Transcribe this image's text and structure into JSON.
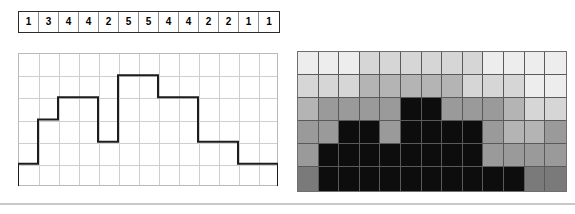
{
  "figure": {
    "panels": {
      "value_strip_name": "Value row",
      "step_chart_name": "Step chart",
      "heatmap_name": "Heatmap"
    }
  },
  "chart_data": [
    {
      "type": "table",
      "title": "",
      "categories": [
        "1",
        "2",
        "3",
        "4",
        "5",
        "6",
        "7",
        "8",
        "9",
        "10",
        "11",
        "12",
        "13"
      ],
      "values": [
        1,
        3,
        4,
        4,
        2,
        5,
        5,
        4,
        4,
        2,
        2,
        1,
        1
      ],
      "labels": [
        "1",
        "3",
        "4",
        "4",
        "2",
        "5",
        "5",
        "4",
        "4",
        "2",
        "2",
        "1",
        "1"
      ],
      "xlabel": "",
      "ylabel": "",
      "grid": true
    },
    {
      "type": "bar",
      "title": "",
      "categories": [
        "1",
        "2",
        "3",
        "4",
        "5",
        "6",
        "7",
        "8",
        "9",
        "10",
        "11",
        "12",
        "13"
      ],
      "values": [
        1,
        3,
        4,
        4,
        2,
        5,
        5,
        4,
        4,
        2,
        2,
        1,
        1
      ],
      "xlabel": "",
      "ylabel": "",
      "ylim": [
        0,
        6
      ],
      "grid": true,
      "gridlines_x": 13,
      "gridlines_y": 6,
      "style": "step-outline",
      "line_color": "#1c1c1c"
    },
    {
      "type": "heatmap",
      "title": "",
      "columns": [
        "1",
        "2",
        "3",
        "4",
        "5",
        "6",
        "7",
        "8",
        "9",
        "10",
        "11",
        "12",
        "13"
      ],
      "rows": [
        "6",
        "5",
        "4",
        "3",
        "2",
        "1"
      ],
      "values": [
        1,
        3,
        4,
        4,
        2,
        5,
        5,
        4,
        4,
        2,
        2,
        1,
        1
      ],
      "xlabel": "",
      "ylabel": "",
      "zlim": [
        0,
        6
      ],
      "colormap": "grayscale",
      "colors_by_level": {
        "0": "#ededed",
        "1": "#d6d6d6",
        "2": "#b4b4b4",
        "3": "#9a9a9a",
        "4": "#7a7a7a",
        "5": "#626262",
        "6": "#0d0d0d"
      },
      "matrix": [
        [
          0,
          0,
          0,
          1,
          1,
          1,
          1,
          1,
          1,
          0,
          0,
          0,
          0
        ],
        [
          1,
          1,
          1,
          2,
          2,
          2,
          2,
          2,
          1,
          1,
          1,
          0,
          0
        ],
        [
          2,
          3,
          3,
          3,
          3,
          6,
          6,
          3,
          3,
          3,
          2,
          1,
          1
        ],
        [
          3,
          3,
          6,
          6,
          3,
          6,
          6,
          6,
          6,
          3,
          2,
          2,
          3
        ],
        [
          3,
          6,
          6,
          6,
          6,
          6,
          6,
          6,
          6,
          3,
          3,
          3,
          3
        ],
        [
          4,
          6,
          6,
          6,
          6,
          6,
          6,
          6,
          6,
          6,
          6,
          4,
          4
        ]
      ]
    }
  ],
  "colors": {
    "grid_line": "#cfcfcf",
    "frame": "#b9b9b9",
    "step_line": "#1c1c1c",
    "strip_border": "#2b2b2b",
    "strip_divider": "#8e8e8e",
    "heatmap_border": "#6f6f6f",
    "rule": "#c9c9c9",
    "background": "#ffffff"
  }
}
